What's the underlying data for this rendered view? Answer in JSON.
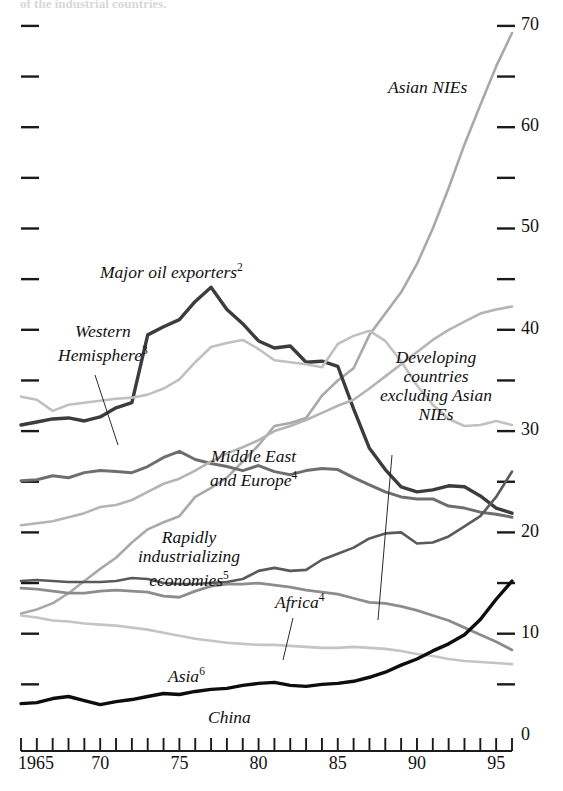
{
  "chart_data": {
    "type": "line",
    "title": "",
    "subtitle": "",
    "xlabel": "",
    "ylabel": "",
    "xlim": [
      1965,
      1996
    ],
    "ylim": [
      0,
      73
    ],
    "grid": false,
    "legend_position": "inline-annotations",
    "y_ticks_major": [
      0,
      10,
      20,
      30,
      40,
      50,
      60,
      70
    ],
    "y_ticks_minor": [
      5,
      15,
      25,
      35,
      45,
      55,
      65
    ],
    "y_tick_labels": [
      "0",
      "10",
      "20",
      "30",
      "40",
      "50",
      "60",
      "70"
    ],
    "x_ticks": [
      1965,
      1966,
      1967,
      1968,
      1969,
      1970,
      1971,
      1972,
      1973,
      1974,
      1975,
      1976,
      1977,
      1978,
      1979,
      1980,
      1981,
      1982,
      1983,
      1984,
      1985,
      1986,
      1987,
      1988,
      1989,
      1990,
      1991,
      1992,
      1993,
      1994,
      1995,
      1996
    ],
    "x_tick_labels": [
      "1965",
      "70",
      "75",
      "80",
      "85",
      "90",
      "95"
    ],
    "x_tick_label_values": [
      1965,
      1970,
      1975,
      1980,
      1985,
      1990,
      1995
    ],
    "x": [
      1965,
      1966,
      1967,
      1968,
      1969,
      1970,
      1971,
      1972,
      1973,
      1974,
      1975,
      1976,
      1977,
      1978,
      1979,
      1980,
      1981,
      1982,
      1983,
      1984,
      1985,
      1986,
      1987,
      1988,
      1989,
      1990,
      1991,
      1992,
      1993,
      1994,
      1995,
      1996
    ],
    "series": [
      {
        "name": "Asian NIEs",
        "color": "#a9a9a9",
        "width": 2.6,
        "values": [
          12.0,
          12.4,
          13.0,
          14.0,
          15.2,
          16.4,
          17.5,
          19.0,
          20.3,
          21.0,
          21.6,
          23.5,
          24.4,
          25.4,
          27.0,
          28.6,
          30.5,
          30.8,
          31.3,
          33.5,
          35.0,
          36.2,
          39.5,
          41.6,
          43.7,
          46.5,
          50.0,
          54.0,
          58.3,
          62.2,
          66.0,
          69.3
        ]
      },
      {
        "name": "Major oil exporters",
        "footnote": "2",
        "color": "#3c3c3c",
        "width": 3.4,
        "values": [
          30.6,
          30.9,
          31.2,
          31.3,
          31.0,
          31.4,
          32.3,
          32.8,
          39.5,
          40.3,
          41.0,
          42.8,
          44.2,
          42.0,
          40.6,
          38.9,
          38.2,
          38.4,
          36.8,
          36.9,
          36.4,
          32.2,
          28.3,
          26.2,
          24.5,
          24.0,
          24.2,
          24.6,
          24.5,
          23.6,
          22.4,
          21.9
        ]
      },
      {
        "name": "Western Hemisphere",
        "footnote": "3",
        "color": "#c0c0c0",
        "width": 2.6,
        "values": [
          33.4,
          33.1,
          32.0,
          32.6,
          32.8,
          33.0,
          33.2,
          33.3,
          33.6,
          34.2,
          35.1,
          36.8,
          38.3,
          38.7,
          39.0,
          38.1,
          37.0,
          36.8,
          36.6,
          36.3,
          38.6,
          39.4,
          39.9,
          38.9,
          36.9,
          34.5,
          32.6,
          31.2,
          30.5,
          30.6,
          31.0,
          30.6
        ]
      },
      {
        "name": "Middle East and Europe",
        "footnote": "4",
        "color": "#6e6e6e",
        "width": 3.0,
        "values": [
          25.1,
          25.2,
          25.6,
          25.4,
          25.9,
          26.1,
          26.0,
          25.9,
          26.5,
          27.4,
          28.0,
          27.2,
          26.8,
          26.5,
          26.1,
          26.6,
          26.0,
          25.7,
          26.1,
          26.3,
          26.2,
          25.4,
          24.7,
          24.0,
          23.5,
          23.3,
          23.3,
          22.6,
          22.4,
          22.0,
          21.8,
          21.5
        ]
      },
      {
        "name": "Developing countries excluding Asian NIEs",
        "color": "#b4b4b4",
        "width": 2.6,
        "values": [
          20.7,
          20.9,
          21.1,
          21.5,
          21.9,
          22.5,
          22.7,
          23.2,
          24.0,
          24.8,
          25.3,
          26.1,
          27.0,
          27.8,
          28.4,
          29.1,
          30.0,
          30.5,
          31.1,
          31.8,
          32.5,
          33.1,
          34.2,
          35.4,
          36.6,
          37.8,
          39.0,
          40.0,
          40.8,
          41.6,
          42.0,
          42.3
        ]
      },
      {
        "name": "Rapidly industrializing economies",
        "footnote": "5",
        "color": "#5a5a5a",
        "width": 2.6,
        "values": [
          15.2,
          15.3,
          15.2,
          15.1,
          15.1,
          15.1,
          15.2,
          15.5,
          15.4,
          15.0,
          14.9,
          14.9,
          15.0,
          15.1,
          15.4,
          16.2,
          16.5,
          16.2,
          16.3,
          17.3,
          17.9,
          18.5,
          19.4,
          19.9,
          20.0,
          18.9,
          19.0,
          19.6,
          20.6,
          21.6,
          23.5,
          26.0
        ]
      },
      {
        "name": "Africa",
        "footnote": "4",
        "color": "#8c8c8c",
        "width": 2.8,
        "values": [
          14.5,
          14.4,
          14.2,
          14.0,
          14.0,
          14.2,
          14.3,
          14.2,
          14.1,
          13.7,
          13.6,
          14.2,
          14.7,
          14.9,
          14.9,
          15.0,
          14.8,
          14.6,
          14.3,
          14.1,
          13.9,
          13.5,
          13.1,
          13.0,
          12.7,
          12.3,
          11.8,
          11.3,
          10.6,
          9.9,
          9.2,
          8.4
        ]
      },
      {
        "name": "Asia",
        "footnote": "6",
        "color": "#c4c4c4",
        "width": 2.6,
        "values": [
          11.8,
          11.6,
          11.3,
          11.2,
          11.0,
          10.9,
          10.8,
          10.6,
          10.4,
          10.1,
          9.8,
          9.5,
          9.3,
          9.1,
          9.0,
          8.9,
          8.9,
          8.8,
          8.7,
          8.6,
          8.6,
          8.7,
          8.6,
          8.5,
          8.3,
          8.0,
          7.8,
          7.5,
          7.3,
          7.2,
          7.1,
          7.0
        ]
      },
      {
        "name": "China",
        "color": "#0d0d0d",
        "width": 3.4,
        "values": [
          3.1,
          3.2,
          3.6,
          3.8,
          3.4,
          3.0,
          3.3,
          3.5,
          3.8,
          4.1,
          4.0,
          4.3,
          4.5,
          4.6,
          4.9,
          5.1,
          5.2,
          4.9,
          4.8,
          5.0,
          5.1,
          5.3,
          5.7,
          6.2,
          6.9,
          7.5,
          8.3,
          9.0,
          9.9,
          11.4,
          13.4,
          15.2
        ]
      }
    ],
    "annotations": [
      {
        "id": "asian-nies",
        "text": "Asian NIEs",
        "footnote": "",
        "x": 388,
        "y": 78,
        "leader": false
      },
      {
        "id": "major-oil-exporters",
        "text": "Major oil exporters",
        "footnote": "2",
        "x": 100,
        "y": 258,
        "leader": false
      },
      {
        "id": "western-hemisphere",
        "text": "Western\nHemisphere",
        "footnote": "3",
        "x": 58,
        "y": 322,
        "leader": true
      },
      {
        "id": "developing-countries-excl-asian-nies",
        "text": "Developing\ncountries\nexcluding Asian\nNIEs",
        "footnote": "",
        "x": 380,
        "y": 348,
        "leader": true
      },
      {
        "id": "middle-east-and-europe",
        "text": "Middle East\nand Europe",
        "footnote": "4",
        "x": 210,
        "y": 447,
        "leader": false
      },
      {
        "id": "rapidly-industrializing-economies",
        "text": "Rapidly\nindustrializing\neconomies",
        "footnote": "5",
        "x": 138,
        "y": 528,
        "leader": false
      },
      {
        "id": "africa",
        "text": "Africa",
        "footnote": "4",
        "x": 275,
        "y": 588,
        "leader": true
      },
      {
        "id": "asia",
        "text": "Asia",
        "footnote": "6",
        "x": 168,
        "y": 662,
        "leader": false
      },
      {
        "id": "china",
        "text": "China",
        "footnote": "",
        "x": 208,
        "y": 708,
        "leader": false
      }
    ],
    "cut_caption": "of the industrial countries."
  },
  "axes": {
    "y_labels": [
      "70",
      "60",
      "50",
      "40",
      "30",
      "20",
      "10",
      "0"
    ],
    "x_labels": [
      "1965",
      "70",
      "75",
      "80",
      "85",
      "90",
      "95"
    ]
  }
}
